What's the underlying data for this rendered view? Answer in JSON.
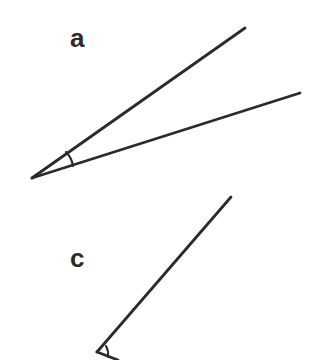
{
  "figure": {
    "width": 330,
    "height": 360,
    "background_color": "#ffffff",
    "stroke_color": "#2b2b2b",
    "stroke_width": 2.8,
    "labels": [
      {
        "id": "a",
        "text": "a",
        "x": 80,
        "y": 38
      },
      {
        "id": "c",
        "text": "c",
        "x": 80,
        "y": 258
      }
    ],
    "angles": [
      {
        "id": "a",
        "label": "a",
        "vertex": {
          "x": 32,
          "y": 178
        },
        "rays": [
          {
            "name": "upper-ray",
            "to": {
              "x": 245,
              "y": 28
            }
          },
          {
            "name": "lower-ray",
            "to": {
              "x": 300,
              "y": 93
            }
          }
        ],
        "arc": {
          "from": {
            "x": 66,
            "y": 152
          },
          "to": {
            "x": 73,
            "y": 166
          }
        }
      },
      {
        "id": "c",
        "label": "c",
        "vertex": {
          "x": 97,
          "y": 352
        },
        "rays": [
          {
            "name": "upper-ray",
            "to": {
              "x": 231,
              "y": 197
            }
          },
          {
            "name": "lower-ray",
            "to": {
              "x": 118,
              "y": 360
            }
          }
        ],
        "arc": {
          "from": {
            "x": 106,
            "y": 346
          },
          "to": {
            "x": 108,
            "y": 357
          }
        }
      }
    ]
  }
}
